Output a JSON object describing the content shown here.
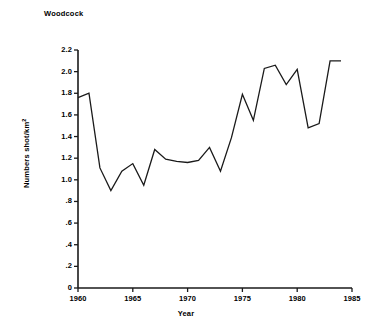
{
  "chart_data": {
    "type": "line",
    "title": "Woodcock",
    "xlabel": "Year",
    "ylabel": "Numbers shot/km",
    "ylabel_superscript": "2",
    "xlim": [
      1960,
      1985
    ],
    "ylim": [
      0,
      2.2
    ],
    "grid": false,
    "legend": null,
    "x": [
      1960,
      1961,
      1962,
      1963,
      1964,
      1965,
      1966,
      1967,
      1968,
      1969,
      1970,
      1971,
      1972,
      1973,
      1974,
      1975,
      1976,
      1977,
      1978,
      1979,
      1980,
      1981,
      1982,
      1983,
      1984
    ],
    "values": [
      1.76,
      1.8,
      1.11,
      0.9,
      1.08,
      1.15,
      0.95,
      1.28,
      1.19,
      1.17,
      1.16,
      1.18,
      1.3,
      1.08,
      1.39,
      1.79,
      1.55,
      2.03,
      2.06,
      1.88,
      2.02,
      1.48,
      1.52,
      2.1,
      2.1
    ],
    "y_ticks": [
      0,
      0.2,
      0.4,
      0.6,
      0.8,
      1.0,
      1.2,
      1.4,
      1.6,
      1.8,
      2.0,
      2.2
    ],
    "y_tick_labels": [
      "0",
      ".2",
      ".4",
      ".6",
      ".8",
      "1.0",
      "1.2",
      "1.4",
      "1.6",
      "1.8",
      "2.0",
      "2.2"
    ],
    "x_ticks": [
      1960,
      1965,
      1970,
      1975,
      1980,
      1985
    ],
    "x_tick_labels": [
      "1960",
      "1965",
      "1970",
      "1975",
      "1980",
      "1985"
    ],
    "line_color": "#1a1a1a",
    "axis_color": "#1a1a1a",
    "background_color": "#ffffff"
  }
}
